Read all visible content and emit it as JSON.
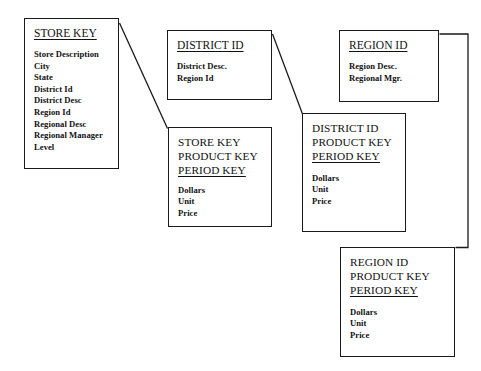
{
  "diagram": {
    "line_color": "#1a1a1a",
    "box_border_color": "#1a1a1a",
    "background": "#ffffff",
    "dimensions": [
      {
        "id": "store-key",
        "title": "STORE KEY",
        "attributes": [
          "Store Description",
          "City",
          "State",
          "District Id",
          "District Desc",
          "Region Id",
          "Regional Desc",
          "Regional Manager",
          "Level"
        ]
      },
      {
        "id": "district-id",
        "title": "DISTRICT ID",
        "attributes": [
          "District Desc.",
          "Region Id"
        ]
      },
      {
        "id": "region-id",
        "title": "REGION ID",
        "attributes": [
          "Region Desc.",
          "Regional Mgr."
        ]
      }
    ],
    "facts": [
      {
        "id": "store-fact",
        "keys": [
          "STORE KEY",
          "PRODUCT KEY",
          "PERIOD KEY"
        ],
        "underlined_key": "PERIOD KEY",
        "measures": [
          "Dollars",
          "Unit",
          "Price"
        ]
      },
      {
        "id": "district-fact",
        "keys": [
          "DISTRICT ID",
          "PRODUCT KEY",
          "PERIOD KEY"
        ],
        "underlined_key": "PERIOD KEY",
        "measures": [
          "Dollars",
          "Unit",
          "Price"
        ]
      },
      {
        "id": "region-fact",
        "keys": [
          "REGION ID",
          "PRODUCT KEY",
          "PERIOD KEY"
        ],
        "underlined_key": "PERIOD KEY",
        "measures": [
          "Dollars",
          "Unit",
          "Price"
        ]
      }
    ],
    "connectors": [
      {
        "id": "store-to-store-fact",
        "from": "store-key",
        "to": "store-fact",
        "style": "diagonal"
      },
      {
        "id": "district-to-district-fact",
        "from": "district-id",
        "to": "district-fact",
        "style": "diagonal"
      },
      {
        "id": "region-to-region-fact",
        "from": "region-id",
        "to": "region-fact",
        "style": "orthogonal"
      }
    ]
  }
}
